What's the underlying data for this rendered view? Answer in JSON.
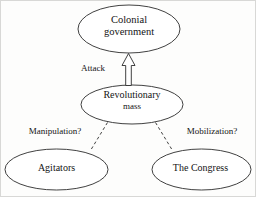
{
  "diagram": {
    "nodes": {
      "colonial_government": {
        "line1": "Colonial",
        "line2": "government"
      },
      "revolutionary_mass": {
        "line1": "Revolutionary",
        "line2": "mass"
      },
      "agitators": {
        "line1": "Agitators"
      },
      "congress": {
        "line1": "The Congress"
      }
    },
    "edges": {
      "attack": "Attack",
      "manipulation": "Manipulation?",
      "mobilization": "Mobilization?"
    },
    "colors": {
      "stroke": "#2b2b2b",
      "fill": "#ffffff",
      "background": "#fdfdfc",
      "text": "#141414"
    }
  }
}
